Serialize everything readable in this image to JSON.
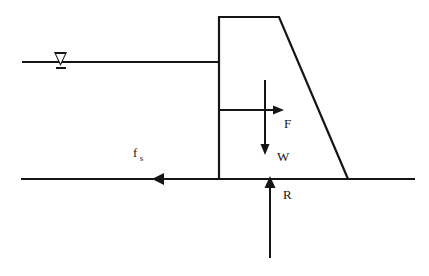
{
  "diagram": {
    "type": "engineering-free-body-diagram",
    "stroke_color": "#151515",
    "background_color": "#ffffff",
    "labels": {
      "friction_symbol": "f",
      "friction_subscript": "s",
      "force_hydrostatic": "F",
      "force_weight": "W",
      "force_reaction": "R"
    },
    "icons": {
      "water_table": "water-table-triangle-icon"
    },
    "geometry": {
      "ground_line": {
        "x1": 21,
        "y1": 179,
        "x2": 415,
        "y2": 179
      },
      "water_line": {
        "x1": 22,
        "y1": 62,
        "x2": 219,
        "y2": 62
      },
      "dam_outline": "M219,179 L219,17 L279,17 L348,179",
      "water_table_marker": {
        "x": 60,
        "y": 62
      },
      "arrow_F": {
        "x1": 219,
        "y1": 110,
        "x2": 282,
        "y2": 110,
        "direction": "right"
      },
      "arrow_W": {
        "x1": 265,
        "y1": 80,
        "x2": 265,
        "y2": 153,
        "direction": "down"
      },
      "arrow_R": {
        "x1": 270,
        "y1": 258,
        "x2": 270,
        "y2": 177,
        "direction": "up"
      },
      "arrow_fs": {
        "x1": 219,
        "y1": 179,
        "x2": 153,
        "y2": 179,
        "direction": "left"
      },
      "inner_face_line": {
        "x1": 219,
        "y1": 110,
        "x2": 219,
        "y2": 179
      }
    }
  }
}
